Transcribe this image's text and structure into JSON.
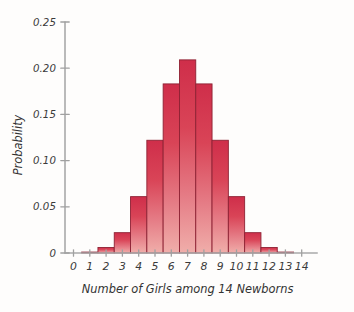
{
  "chart_data": {
    "type": "bar",
    "title": "",
    "subtitle": "",
    "xlabel": "Number of Girls among 14 Newborns",
    "ylabel": "Probability",
    "categories": [
      "0",
      "1",
      "2",
      "3",
      "4",
      "5",
      "6",
      "7",
      "8",
      "9",
      "10",
      "11",
      "12",
      "13",
      "14"
    ],
    "values": [
      0.0,
      0.001,
      0.006,
      0.022,
      0.061,
      0.122,
      0.183,
      0.209,
      0.183,
      0.122,
      0.061,
      0.022,
      0.006,
      0.001,
      0.0
    ],
    "xlim": [
      -0.5,
      14.5
    ],
    "ylim": [
      0,
      0.25
    ],
    "ytick_labels": [
      "0",
      "0.05",
      "0.10",
      "0.15",
      "0.20",
      "0.25"
    ],
    "ytick_values": [
      0,
      0.05,
      0.1,
      0.15,
      0.2,
      0.25
    ],
    "xtick_labels": [
      "0",
      "1",
      "2",
      "3",
      "4",
      "5",
      "6",
      "7",
      "8",
      "9",
      "10",
      "11",
      "12",
      "13",
      "14"
    ],
    "grid": false,
    "legend": null,
    "legend_position": "none",
    "annotations": [],
    "bar_color_top": "#d3334e",
    "bar_color_bottom": "#efa7a8",
    "bar_edge_color": "#8e2234",
    "axis_color": "#a9a9a9",
    "text_color": "#3a3a3a",
    "background_color": "#fefdfc"
  }
}
